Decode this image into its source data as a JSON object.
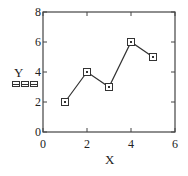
{
  "chart_data": {
    "type": "line",
    "title": "",
    "xlabel": "X",
    "ylabel": "Y",
    "x": [
      1,
      2,
      3,
      4,
      5
    ],
    "series": [
      {
        "name": "Y",
        "values": [
          2,
          4,
          3,
          6,
          5
        ],
        "marker": "square",
        "color": "#333333"
      }
    ],
    "xlim": [
      0,
      6
    ],
    "ylim": [
      0,
      8
    ],
    "xticks": [
      0,
      2,
      4,
      6
    ],
    "yticks": [
      0,
      2,
      4,
      6,
      8
    ],
    "xtick_labels": [
      "0",
      "2",
      "4",
      "6"
    ],
    "ytick_labels": [
      "0",
      "2",
      "4",
      "6",
      "8"
    ],
    "grid": false,
    "legend": false,
    "ylabel_placeholder": "□□□"
  }
}
